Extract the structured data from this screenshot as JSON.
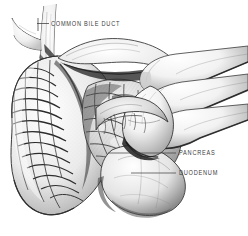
{
  "figure": {
    "type": "anatomical-illustration",
    "medium": "pen-and-ink grayscale drawing",
    "background_color": "#ffffff",
    "ink_color": "#2b2b2b",
    "label_color": "#3b3b3b",
    "width": 248,
    "height": 236
  },
  "labels": [
    {
      "id": "common-bile-duct",
      "text": "COMMON BILE DUCT",
      "text_x": 51,
      "text_y": 20.5,
      "leader": {
        "x1": 49,
        "y1": 23.5,
        "x2": 37,
        "y2": 23.5
      },
      "tick": {
        "x": 38,
        "y1": 18,
        "y2": 31
      }
    },
    {
      "id": "pancreas",
      "text": "PANCREAS",
      "text_x": 179,
      "text_y": 150,
      "leader": {
        "x1": 176,
        "y1": 153,
        "x2": 108,
        "y2": 153
      },
      "tick": null
    },
    {
      "id": "duodenum",
      "text": "DUODENUM",
      "text_x": 179,
      "text_y": 170,
      "leader": {
        "x1": 176,
        "y1": 173,
        "x2": 131,
        "y2": 173
      },
      "tick": null
    }
  ],
  "structures": [
    {
      "name": "common-bile-duct",
      "description": "branching duct at upper left"
    },
    {
      "name": "pancreas",
      "description": "lobulated glandular tissue in center"
    },
    {
      "name": "duodenum",
      "description": "C-shaped bowel loop with mucosal folds at left and lower border"
    },
    {
      "name": "examining-hand",
      "description": "fingers entering from upper right palpating the gland"
    }
  ]
}
